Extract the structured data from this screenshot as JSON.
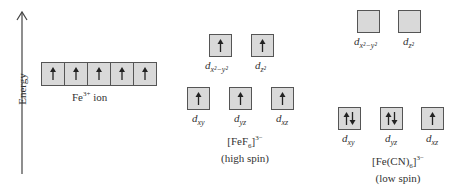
{
  "axis": {
    "label": "Energy"
  },
  "free_ion": {
    "label_main": "Fe",
    "label_sup": "3+",
    "label_tail": " ion",
    "electrons": [
      "up",
      "up",
      "up",
      "up",
      "up"
    ]
  },
  "high_spin": {
    "complex_main": "[FeF",
    "complex_sub": "6",
    "complex_close": "]",
    "complex_sup": "3−",
    "spin_label": "(high spin)",
    "upper": [
      {
        "orbital": "d",
        "sub": "x²−y²",
        "electrons": "up"
      },
      {
        "orbital": "d",
        "sub": "z²",
        "electrons": "up"
      }
    ],
    "lower": [
      {
        "orbital": "d",
        "sub": "xy",
        "electrons": "up"
      },
      {
        "orbital": "d",
        "sub": "yz",
        "electrons": "up"
      },
      {
        "orbital": "d",
        "sub": "xz",
        "electrons": "up"
      }
    ]
  },
  "low_spin": {
    "complex_main": "[Fe(CN)",
    "complex_sub": "6",
    "complex_close": "]",
    "complex_sup": "3−",
    "spin_label": "(low spin)",
    "upper": [
      {
        "orbital": "d",
        "sub": "x²−y²",
        "electrons": "empty"
      },
      {
        "orbital": "d",
        "sub": "z²",
        "electrons": "empty"
      }
    ],
    "lower": [
      {
        "orbital": "d",
        "sub": "xy",
        "electrons": "pair"
      },
      {
        "orbital": "d",
        "sub": "yz",
        "electrons": "pair"
      },
      {
        "orbital": "d",
        "sub": "xz",
        "electrons": "up"
      }
    ]
  }
}
